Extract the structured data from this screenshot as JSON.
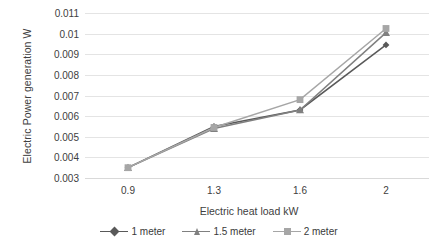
{
  "chart_data": {
    "type": "line",
    "title": "",
    "xlabel": "Electric heat load kW",
    "ylabel": "Electric Power generation W",
    "categories": [
      "0.9",
      "1.3",
      "1.6",
      "2"
    ],
    "x_tick_labels": [
      "0.9",
      "1.3",
      "1.6",
      "2"
    ],
    "y_tick_labels": [
      "0.011",
      "0.01",
      "0.009",
      "0.008",
      "0.007",
      "0.006",
      "0.005",
      "0.004",
      "0.003"
    ],
    "y_tick_values": [
      0.011,
      0.01,
      0.009,
      0.008,
      0.007,
      0.006,
      0.005,
      0.004,
      0.003
    ],
    "ylim": [
      0.003,
      0.011
    ],
    "grid": true,
    "legend_position": "bottom",
    "series": [
      {
        "name": "1 meter",
        "marker": "diamond",
        "color": "#595959",
        "values": [
          0.0035,
          0.0055,
          0.0063,
          0.00945
        ]
      },
      {
        "name": "1.5 meter",
        "marker": "triangle",
        "color": "#808080",
        "values": [
          0.0035,
          0.0054,
          0.0063,
          0.01005
        ]
      },
      {
        "name": "2 meter",
        "marker": "square",
        "color": "#a6a6a6",
        "values": [
          0.0035,
          0.00545,
          0.0068,
          0.01025
        ]
      }
    ]
  },
  "legend": {
    "entries": [
      {
        "label": "1 meter"
      },
      {
        "label": "1.5 meter"
      },
      {
        "label": "2 meter"
      }
    ]
  }
}
